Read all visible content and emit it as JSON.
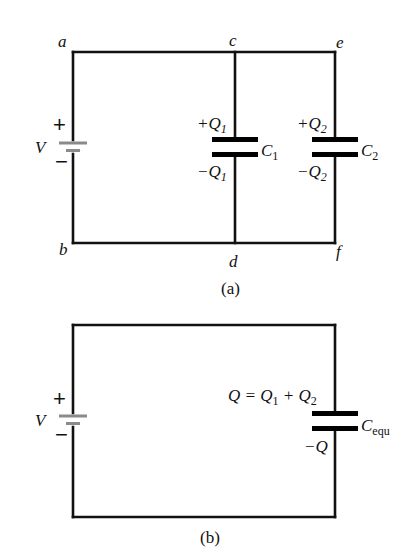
{
  "figure": {
    "panel_a": {
      "caption": "(a)",
      "nodes": {
        "a": "a",
        "b": "b",
        "c": "c",
        "d": "d",
        "e": "e",
        "f": "f"
      },
      "battery": {
        "label": "V",
        "plus": "+",
        "minus": "−"
      },
      "capacitors": [
        {
          "name": "C",
          "sub": "1",
          "plus_charge": "+Q",
          "plus_sub": "1",
          "minus_charge": "−Q",
          "minus_sub": "1"
        },
        {
          "name": "C",
          "sub": "2",
          "plus_charge": "+Q",
          "plus_sub": "2",
          "minus_charge": "−Q",
          "minus_sub": "2"
        }
      ]
    },
    "panel_b": {
      "caption": "(b)",
      "battery": {
        "label": "V",
        "plus": "+",
        "minus": "−"
      },
      "capacitor": {
        "name": "C",
        "sub": "equ",
        "top_charge": {
          "q": "Q = Q",
          "s1": "1",
          "plus": " + Q",
          "s2": "2"
        },
        "minus_charge": "−Q"
      }
    },
    "colors": {
      "wire": "#111111",
      "plate": "#000000",
      "battery_plate": "#8a8a8a",
      "background": "#ffffff"
    }
  }
}
